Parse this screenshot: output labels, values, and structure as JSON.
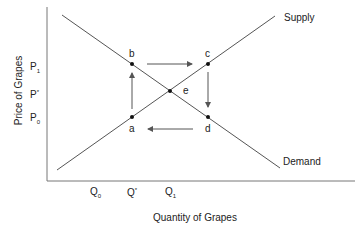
{
  "diagram": {
    "type": "supply-demand",
    "x_axis_label": "Quantity of Grapes",
    "y_axis_label": "Price of Grapes",
    "price_ticks": [
      {
        "base": "P",
        "mark": "1",
        "kind": "sub"
      },
      {
        "base": "P",
        "mark": "*",
        "kind": "sup"
      },
      {
        "base": "P",
        "mark": "0",
        "kind": "sub"
      }
    ],
    "quantity_ticks": [
      {
        "base": "Q",
        "mark": "0",
        "kind": "sub"
      },
      {
        "base": "Q",
        "mark": "*",
        "kind": "sup"
      },
      {
        "base": "Q",
        "mark": "1",
        "kind": "sub"
      }
    ],
    "curves": {
      "supply": "Supply",
      "demand": "Demand"
    },
    "points": {
      "a": "a",
      "b": "b",
      "c": "c",
      "d": "d",
      "e": "e"
    },
    "line_color": "#555555",
    "point_color": "#111111"
  }
}
